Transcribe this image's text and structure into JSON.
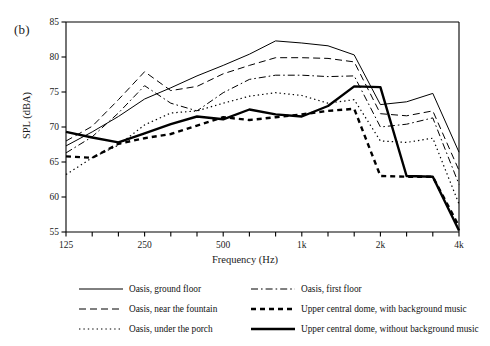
{
  "panel_label": "(b)",
  "axes": {
    "ylabel": "SPL (dBA)",
    "xlabel": "Frequency (Hz)",
    "yticks": [
      "55",
      "60",
      "65",
      "70",
      "75",
      "80",
      "85"
    ],
    "xticks_labeled": [
      "125",
      "250",
      "500",
      "1k",
      "2k",
      "4k"
    ]
  },
  "legend": {
    "left": [
      {
        "label": "Oasis, ground floor",
        "style": "solid-thin"
      },
      {
        "label": "Oasis, near the fountain",
        "style": "dashed"
      },
      {
        "label": "Oasis, under the porch",
        "style": "dotted"
      }
    ],
    "right": [
      {
        "label": "Oasis, first floor",
        "style": "dash-dot"
      },
      {
        "label": "Upper central dome, with background music",
        "style": "dashed-thick"
      },
      {
        "label": "Upper central dome, without background music",
        "style": "solid-thick"
      }
    ]
  },
  "chart_data": {
    "type": "line",
    "title": "",
    "xlabel": "Frequency (Hz)",
    "ylabel": "SPL (dBA)",
    "ylim": [
      55,
      85
    ],
    "ytick_step": 5,
    "grid": false,
    "legend_position": "bottom",
    "x_scale": "log-third-octave",
    "categories": [
      "125",
      "160",
      "200",
      "250",
      "315",
      "400",
      "500",
      "630",
      "800",
      "1k",
      "1.25k",
      "1.6k",
      "2k",
      "2.5k",
      "3.15k",
      "4k"
    ],
    "xtick_labels": [
      "125",
      "",
      "",
      "250",
      "",
      "",
      "500",
      "",
      "",
      "1k",
      "",
      "",
      "2k",
      "",
      "",
      "4k"
    ],
    "series": [
      {
        "name": "Oasis, ground floor",
        "style": "solid-thin",
        "values": [
          67.3,
          69.3,
          71.5,
          74.0,
          75.6,
          77.3,
          78.8,
          80.4,
          82.3,
          82.0,
          81.6,
          80.3,
          73.2,
          73.6,
          74.8,
          66.4
        ]
      },
      {
        "name": "Oasis, near the fountain",
        "style": "dashed",
        "values": [
          68.0,
          70.1,
          73.9,
          77.9,
          75.2,
          75.8,
          77.6,
          78.8,
          79.9,
          79.9,
          79.8,
          79.3,
          71.9,
          71.6,
          72.3,
          63.8
        ]
      },
      {
        "name": "Oasis, under the porch",
        "style": "dotted",
        "values": [
          63.2,
          65.6,
          67.4,
          70.3,
          72.0,
          72.3,
          73.4,
          74.4,
          74.9,
          74.5,
          73.4,
          73.9,
          68.0,
          67.8,
          68.4,
          59.0
        ]
      },
      {
        "name": "Oasis, first floor",
        "style": "dash-dot",
        "values": [
          66.3,
          68.6,
          72.0,
          75.9,
          73.4,
          72.3,
          74.9,
          76.8,
          77.4,
          77.4,
          77.2,
          77.3,
          70.0,
          70.4,
          71.3,
          61.8
        ]
      },
      {
        "name": "Upper central dome, with background music",
        "style": "dashed-thick",
        "values": [
          65.8,
          65.6,
          67.6,
          68.4,
          69.0,
          70.2,
          71.4,
          71.0,
          71.4,
          71.8,
          72.3,
          72.6,
          63.0,
          62.9,
          62.9,
          55.8
        ]
      },
      {
        "name": "Upper central dome, without background music",
        "style": "solid-thick",
        "values": [
          69.3,
          68.5,
          67.8,
          69.1,
          70.4,
          71.5,
          71.1,
          72.5,
          71.8,
          71.5,
          73.0,
          75.8,
          75.7,
          63.0,
          62.9,
          55.2
        ]
      }
    ]
  }
}
